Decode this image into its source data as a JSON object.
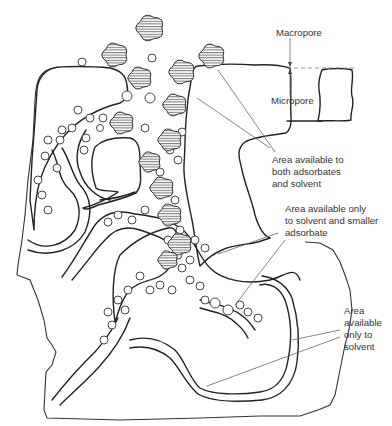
{
  "diagram": {
    "labels": {
      "macropore": "Macropore",
      "micropore": "Micropore",
      "both": [
        "Area available to",
        "both adsorbates",
        "and solvent"
      ],
      "solvent_smaller": [
        "Area available only",
        "to solvent and smaller",
        "adsorbate"
      ],
      "solvent_only": [
        "Area",
        "available",
        "only to",
        "solvent"
      ]
    },
    "legend_items": [
      {
        "symbol": "hatched-blob",
        "meaning": "larger adsorbate molecule"
      },
      {
        "symbol": "open-circle",
        "meaning": "smaller adsorbate / solvent molecule"
      }
    ]
  }
}
